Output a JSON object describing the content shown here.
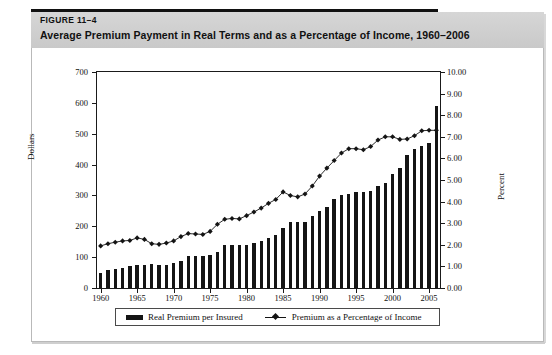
{
  "figure": {
    "number_label": "FIGURE 11–4",
    "title": "Average Premium Payment in Real Terms and as a Percentage of Income, 1960–2006"
  },
  "legend": {
    "items": [
      {
        "key": "bars",
        "label": "Real Premium per Insured",
        "marker": "bar-swatch",
        "color": "#141414"
      },
      {
        "key": "line",
        "label": "Premium as a Percentage of Income",
        "marker": "line-diamond-swatch",
        "color": "#141414"
      }
    ]
  },
  "chart_data": {
    "type": "bar",
    "title": "Average Premium Payment in Real Terms and as a Percentage of Income, 1960–2006",
    "xlabel": "",
    "ylabel": "Dollars",
    "y2label": "Percent",
    "ylim": [
      0,
      700
    ],
    "y2lim": [
      0,
      10
    ],
    "yticks": [
      "0",
      "100",
      "200",
      "300",
      "400",
      "500",
      "600",
      "700"
    ],
    "y2ticks": [
      "0.00",
      "1.00",
      "2.00",
      "3.00",
      "4.00",
      "5.00",
      "6.00",
      "7.00",
      "8.00",
      "9.00",
      "10.00"
    ],
    "xticks": [
      "1960",
      "1965",
      "1970",
      "1975",
      "1980",
      "1985",
      "1990",
      "1995",
      "2000",
      "2005"
    ],
    "grid": false,
    "legend_position": "below-axes",
    "x": [
      1960,
      1961,
      1962,
      1963,
      1964,
      1965,
      1966,
      1967,
      1968,
      1969,
      1970,
      1971,
      1972,
      1973,
      1974,
      1975,
      1976,
      1977,
      1978,
      1979,
      1980,
      1981,
      1982,
      1983,
      1984,
      1985,
      1986,
      1987,
      1988,
      1989,
      1990,
      1991,
      1992,
      1993,
      1994,
      1995,
      1996,
      1997,
      1998,
      1999,
      2000,
      2001,
      2002,
      2003,
      2004,
      2005,
      2006
    ],
    "series": [
      {
        "name": "Real Premium per Insured",
        "type": "bar",
        "axis": "left",
        "unit": "dollars",
        "color": "#141414",
        "values": [
          50,
          58,
          62,
          66,
          70,
          75,
          76,
          78,
          76,
          76,
          80,
          86,
          103,
          104,
          104,
          107,
          118,
          140,
          140,
          140,
          138,
          145,
          152,
          162,
          172,
          195,
          215,
          215,
          213,
          232,
          250,
          262,
          290,
          300,
          305,
          310,
          310,
          315,
          330,
          340,
          370,
          390,
          430,
          450,
          460,
          470,
          590
        ]
      },
      {
        "name": "Premium as a Percentage of Income",
        "type": "line",
        "axis": "right",
        "unit": "percent",
        "color": "#141414",
        "marker": "diamond",
        "values": [
          1.95,
          2.05,
          2.12,
          2.18,
          2.2,
          2.32,
          2.25,
          2.05,
          2.02,
          2.08,
          2.18,
          2.38,
          2.52,
          2.5,
          2.48,
          2.62,
          2.95,
          3.18,
          3.22,
          3.2,
          3.35,
          3.52,
          3.7,
          3.92,
          4.1,
          4.45,
          4.28,
          4.22,
          4.35,
          4.72,
          5.18,
          5.55,
          5.9,
          6.25,
          6.45,
          6.45,
          6.4,
          6.55,
          6.85,
          7.0,
          7.0,
          6.88,
          6.9,
          7.05,
          7.28,
          7.3,
          7.3
        ]
      }
    ]
  }
}
